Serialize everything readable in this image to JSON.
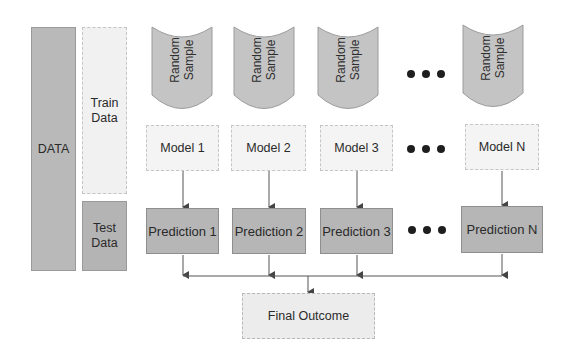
{
  "data_column": {
    "data_label": "DATA",
    "train_label": "Train\nData",
    "test_label": "Test\nData"
  },
  "samples": [
    {
      "label": "Random Sample"
    },
    {
      "label": "Random Sample"
    },
    {
      "label": "Random Sample"
    },
    {
      "label": "Random Sample"
    }
  ],
  "models": [
    {
      "label": "Model 1"
    },
    {
      "label": "Model 2"
    },
    {
      "label": "Model 3"
    },
    {
      "label": "Model N"
    }
  ],
  "predictions": [
    {
      "label": "Prediction 1"
    },
    {
      "label": "Prediction 2"
    },
    {
      "label": "Prediction 3"
    },
    {
      "label": "Prediction N"
    }
  ],
  "final": {
    "label": "Final Outcome"
  },
  "ellipsis": "•••",
  "colors": {
    "dark_fill": "#b6b6b6",
    "light_fill": "#f2f2f2",
    "sample_fill": "#c4c4c4",
    "line": "#4a4a4a"
  }
}
